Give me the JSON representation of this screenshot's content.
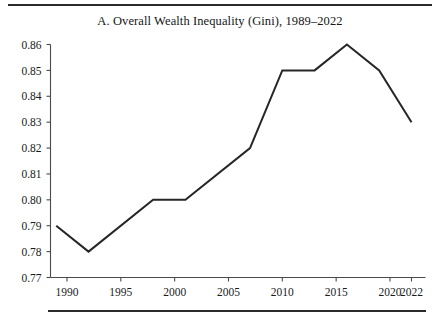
{
  "figure": {
    "panel_label": "A.",
    "title": "A. Overall Wealth Inequality (Gini), 1989–2022",
    "rule_top_label": "top-divider",
    "rule_bottom_label": "bottom-divider",
    "background_color": "#ffffff",
    "line_color": "#262626",
    "axis_color": "#4a4a4a"
  },
  "chart_data": {
    "type": "line",
    "title": "A. Overall Wealth Inequality (Gini), 1989–2022",
    "xlabel": "",
    "ylabel": "",
    "x": [
      1989,
      1992,
      1998,
      2001,
      2007,
      2010,
      2013,
      2016,
      2019,
      2022
    ],
    "values": [
      0.79,
      0.78,
      0.8,
      0.8,
      0.82,
      0.85,
      0.85,
      0.86,
      0.85,
      0.83
    ],
    "series": [
      {
        "name": "Overall Wealth Gini",
        "values": [
          0.79,
          0.78,
          0.8,
          0.8,
          0.82,
          0.85,
          0.85,
          0.86,
          0.85,
          0.83
        ]
      }
    ],
    "xlim": [
      1989,
      2022
    ],
    "ylim": [
      0.77,
      0.86
    ],
    "ytick_labels": [
      "0.86",
      "0.85",
      "0.84",
      "0.83",
      "0.82",
      "0.81",
      "0.80",
      "0.79",
      "0.78",
      "0.77"
    ],
    "ytick_values": [
      0.86,
      0.85,
      0.84,
      0.83,
      0.82,
      0.81,
      0.8,
      0.79,
      0.78,
      0.77
    ],
    "xtick_labels": [
      "1990",
      "1995",
      "2000",
      "2005",
      "2010",
      "2015",
      "2020",
      "2022"
    ],
    "xtick_values": [
      1990,
      1995,
      2000,
      2005,
      2010,
      2015,
      2020,
      2022
    ],
    "grid": false,
    "legend": false,
    "legend_position": "none"
  }
}
